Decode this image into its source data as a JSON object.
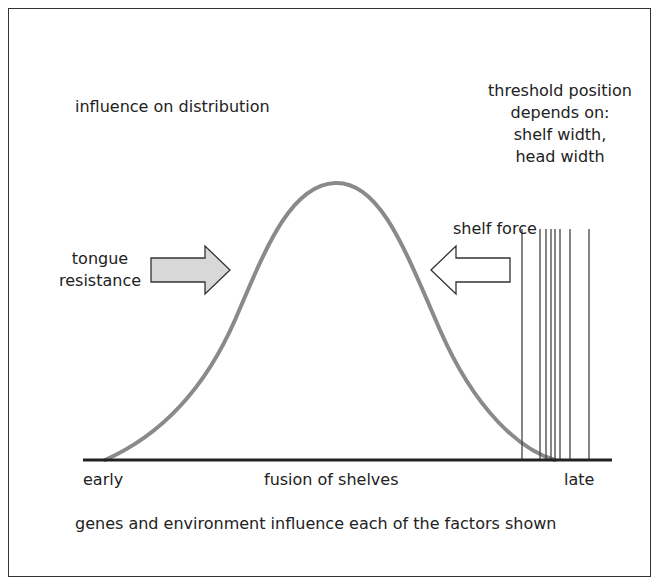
{
  "diagram": {
    "title_left": "influence on distribution",
    "threshold_label": [
      "threshold position",
      "depends on:",
      "shelf width,",
      "head width"
    ],
    "shelf_force_label": "shelf force",
    "tongue_resistance_label": [
      "tongue",
      "resistance"
    ],
    "axis": {
      "left_label": "early",
      "center_label": "fusion of shelves",
      "right_label": "late"
    },
    "footer": "genes and environment influence each of the factors shown",
    "colors": {
      "curve": "#8a8a8a",
      "axis": "#222222",
      "arrow_left_fill": "#d8d8d8",
      "arrow_right_fill": "#ffffff",
      "threshold_lines": "#444444",
      "border": "#333333"
    },
    "threshold_line_x": [
      522,
      540,
      546,
      551,
      555,
      560,
      570,
      589
    ]
  }
}
